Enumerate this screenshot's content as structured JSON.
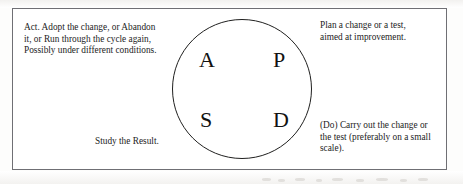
{
  "diagram": {
    "circle": {
      "name": "pdsa-cycle-circle",
      "letters": [
        {
          "id": "act",
          "label": "A",
          "position": "top-left"
        },
        {
          "id": "plan",
          "label": "P",
          "position": "top-right"
        },
        {
          "id": "study",
          "label": "S",
          "position": "bottom-left"
        },
        {
          "id": "do",
          "label": "D",
          "position": "bottom-right"
        }
      ]
    },
    "annotations": {
      "act": "Act. Adopt the change, or Abandon\nit, or Run through the cycle again,\nPossibly under different conditions.",
      "plan": "Plan a change or a test,\naimed at improvement.",
      "do": "(Do) Carry out the change or\nthe test (preferably on a small\nscale).",
      "study": "Study the Result."
    },
    "colors": {
      "ink": "#1a1a1a",
      "frame_border": "#6f6f74",
      "circle_stroke": "#20201f",
      "page_background": "#ffffff"
    }
  }
}
